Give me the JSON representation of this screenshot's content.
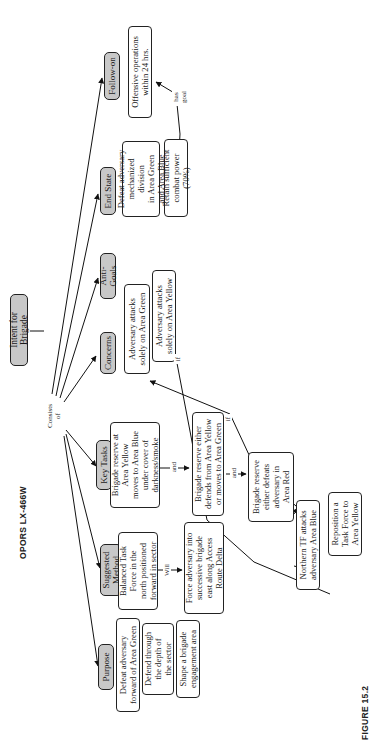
{
  "title": "OPORS LX-466W",
  "root": "Intent for Brigade",
  "root_link": "Consists\nof",
  "categories": {
    "purpose": "Purpose",
    "suggested_method": "Suggested\nMethod",
    "key_tasks": "Key Tasks",
    "concerns": "Concerns",
    "anti_goals": "Anti-Goals",
    "end_state": "End State",
    "follow_on": "Follow-on"
  },
  "purpose_items": [
    "Defeat adversary\nforward of Area Green",
    "Defend through\nthe depth of\nthe sector",
    "Shape a brigade\nengagement area"
  ],
  "suggested_method": {
    "item": "Balanced Task\nForce in the\nnorth positioned\nforward in sector",
    "link": "Will",
    "result": "Force adversary into\nsuccessive brigade\neast along Access\nRoute Delta"
  },
  "key_tasks": {
    "items": [
      "Brigade reserve at\nArea Yellow\nmoves to Area Blue\nunder cover of\ndarkness/smoke",
      "Brigade reserve either\ndefends from Area Yellow\nor moves to Area Green",
      "Brigade reserve\neither defeats\nadversary in\nArea Red",
      "Northern TF attacks\nadversary Area Blue",
      "Reposition a\nTask Force to\nArea Yellow"
    ],
    "links": [
      "and",
      "and"
    ]
  },
  "concerns_items": [
    "Adversary attacks\nsolely on Area Green",
    "Adversary attacks\nsolely on Area Yellow"
  ],
  "if_labels": [
    "if",
    "if"
  ],
  "end_state_items": [
    "Defeat adversary\nmechanized division\nin Area Green\nand Area Blue",
    "Retain sufficient\ncombat power (70%)"
  ],
  "follow_on_item": "Offensive operations\nwithin 24 hrs.",
  "goal_link": "has\ngoal",
  "figure_caption": "FIGURE 15.2"
}
